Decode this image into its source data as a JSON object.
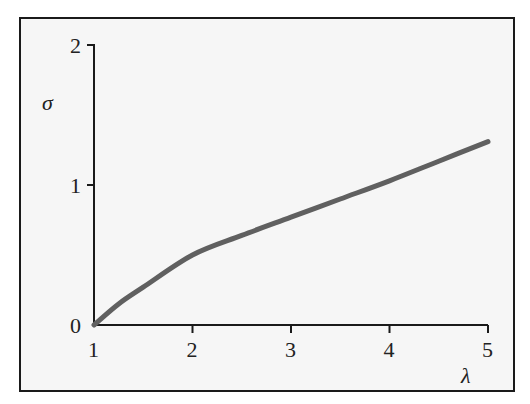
{
  "chart_data": {
    "type": "line",
    "title": "",
    "xlabel": "λ",
    "ylabel": "σ",
    "xlim": [
      1,
      5
    ],
    "ylim": [
      0,
      2
    ],
    "xticks": [
      "1",
      "2",
      "3",
      "4",
      "5"
    ],
    "yticks": [
      "0",
      "1",
      "2"
    ],
    "grid": false,
    "legend": null,
    "series": [
      {
        "name": "σ(λ)",
        "color": "#606060",
        "x": [
          1,
          1.25,
          1.5,
          2,
          2.5,
          3,
          3.5,
          4,
          4.5,
          5
        ],
        "values": [
          0,
          0.15,
          0.27,
          0.5,
          0.64,
          0.77,
          0.9,
          1.03,
          1.17,
          1.31
        ]
      }
    ]
  },
  "axes": {
    "x_label": "λ",
    "y_label": "σ",
    "x_ticks": [
      "1",
      "2",
      "3",
      "4",
      "5"
    ],
    "y_ticks": [
      "0",
      "1",
      "2"
    ]
  }
}
